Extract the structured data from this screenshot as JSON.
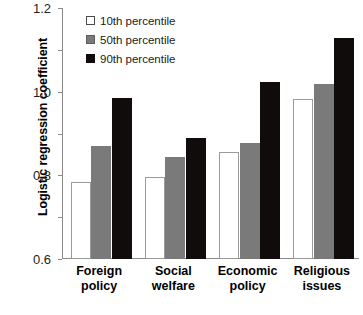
{
  "chart_data": {
    "type": "bar",
    "title": "",
    "xlabel": "",
    "ylabel": "Logistic regression coefficient",
    "ylim": [
      0.0,
      1.2
    ],
    "yticks": [
      "0.0",
      "0.2",
      "0.4",
      "0.6",
      "0.8",
      "1.0",
      "1.2"
    ],
    "ytick_values": [
      0.0,
      0.2,
      0.4,
      0.6,
      0.8,
      1.0,
      1.2
    ],
    "grid": false,
    "legend_position": "top-left-inside",
    "categories": [
      "Foreign policy",
      "Social welfare",
      "Economic policy",
      "Religious issues"
    ],
    "category_lines": [
      [
        "Foreign",
        "policy"
      ],
      [
        "Social",
        "welfare"
      ],
      [
        "Economic",
        "policy"
      ],
      [
        "Religious",
        "issues"
      ]
    ],
    "series": [
      {
        "name": "10th percentile",
        "color": "#ffffff",
        "values": [
          0.37,
          0.39,
          0.51,
          0.765
        ]
      },
      {
        "name": "50th percentile",
        "color": "#7a7a7a",
        "values": [
          0.54,
          0.49,
          0.555,
          0.835
        ]
      },
      {
        "name": "90th percentile",
        "color": "#100c0c",
        "values": [
          0.77,
          0.58,
          0.845,
          1.055
        ]
      }
    ]
  },
  "legend": {
    "items": [
      {
        "label": "10th  percentile",
        "swatch": "white-square-icon"
      },
      {
        "label": "50th  percentile",
        "swatch": "gray-square-icon"
      },
      {
        "label": "90th  percentile",
        "swatch": "black-square-icon"
      }
    ]
  },
  "axis": {
    "y_title": "Logistic regression coefficient"
  }
}
